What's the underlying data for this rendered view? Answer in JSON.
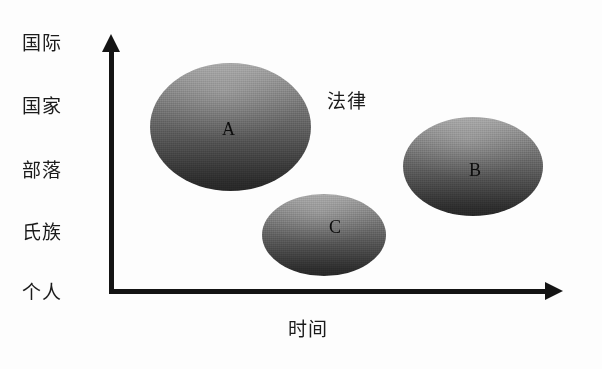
{
  "figure": {
    "background_color": "#fdfdfd",
    "axis_color": "#141414",
    "blob_top_color": "#a2a2a2",
    "blob_bottom_color": "#272727",
    "label_color": "#1b1b1b"
  },
  "chart_data": {
    "type": "scatter",
    "title": "",
    "subtitle": "",
    "xlabel": "时间",
    "ylabel": "",
    "grid": false,
    "legend_position": "none",
    "x_axis": {
      "label": "时间",
      "arrow": true,
      "tick_labels": [],
      "direction": "right"
    },
    "y_axis": {
      "label": "",
      "arrow": true,
      "direction": "up",
      "categories": [
        "个人",
        "氏族",
        "部落",
        "国家",
        "国际"
      ],
      "tick_labels_top_to_bottom": [
        "国际",
        "国家",
        "部落",
        "氏族",
        "个人"
      ]
    },
    "annotations": [
      {
        "name": "annotation-law",
        "text": "法律",
        "x": 0.62,
        "y": 0.8
      }
    ],
    "series": [
      {
        "name": "blobs",
        "points": [
          {
            "label": "A",
            "shape": "ellipse",
            "x_center": 0.29,
            "y_center": 0.73,
            "width": 0.36,
            "height": 0.5,
            "orientation": "tall"
          },
          {
            "label": "C",
            "shape": "ellipse",
            "x_center": 0.53,
            "y_center": 0.29,
            "width": 0.28,
            "height": 0.32,
            "orientation": "wide"
          },
          {
            "label": "B",
            "shape": "ellipse",
            "x_center": 0.84,
            "y_center": 0.57,
            "width": 0.31,
            "height": 0.39,
            "orientation": "wide"
          }
        ]
      }
    ]
  },
  "axes": {
    "x": {
      "title": "时间"
    },
    "y": {
      "ticks": [
        {
          "label": "国际"
        },
        {
          "label": "国家"
        },
        {
          "label": "部落"
        },
        {
          "label": "氏族"
        },
        {
          "label": "个人"
        }
      ]
    }
  },
  "annotations": {
    "law": "法律"
  },
  "blobs": {
    "a": {
      "label": "A"
    },
    "b": {
      "label": "B"
    },
    "c": {
      "label": "C"
    }
  }
}
